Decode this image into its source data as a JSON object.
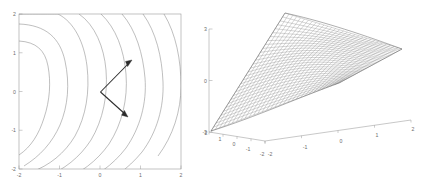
{
  "figure": {
    "title": "",
    "background_color": "#ffffff",
    "panel_count": 2
  },
  "chart_data": [
    {
      "type": "contour",
      "title": "",
      "xlabel": "",
      "ylabel": "",
      "xlim": [
        -2,
        2
      ],
      "ylim": [
        -2,
        2
      ],
      "xticks": [
        "-2",
        "-1",
        "0",
        "1",
        "2"
      ],
      "yticks": [
        "2",
        "1",
        "0",
        "-1",
        "-2"
      ],
      "xtick_values": [
        -2,
        -1,
        0,
        1,
        2
      ],
      "ytick_values": [
        2,
        1,
        0,
        -1,
        -2
      ],
      "grid": false,
      "legend": "none",
      "contour_count": 8,
      "contour_levels": [
        0.5,
        1.5,
        3,
        5,
        8,
        12,
        17,
        23
      ],
      "line_color": "#8a8a8a",
      "annotation": {
        "name": "gradient-vector-path",
        "type": "polyline-double-arrow",
        "color": "#2b2b2b",
        "points": [
          [
            0.72,
            0.62
          ],
          [
            0.02,
            0.0
          ],
          [
            0.66,
            -0.55
          ]
        ],
        "arrowheads": [
          "start",
          "end"
        ],
        "description": "V-shaped two-segment arrow with arrowheads at both outer tips, vertex near origin"
      }
    },
    {
      "type": "surface",
      "title": "",
      "xlabel": "",
      "ylabel": "",
      "zlabel": "",
      "xlim": [
        -2,
        2
      ],
      "ylim": [
        -2,
        2
      ],
      "zlim": [
        -3,
        3
      ],
      "xticks": [
        "-2",
        "-1",
        "0",
        "1",
        "2"
      ],
      "yticks": [
        "2",
        "1",
        "0",
        "-1",
        "-2"
      ],
      "zticks": [
        "3",
        "0",
        "-3"
      ],
      "xtick_values": [
        -2,
        -1,
        0,
        1,
        2
      ],
      "ytick_values": [
        2,
        1,
        0,
        -1,
        -2
      ],
      "ztick_values": [
        3,
        0,
        -3
      ],
      "grid": false,
      "legend": "none",
      "mesh_color": "#747474",
      "mesh_resolution": [
        30,
        30
      ],
      "view": {
        "azimuth": -37.5,
        "elevation": 30
      },
      "description": "Saddle-shaped wireframe mesh surface rising steeply to back-left ridge and tapering to a point at the near corner"
    }
  ],
  "panels": {
    "contour": {
      "name": "contour-plot"
    },
    "surface": {
      "name": "surface-plot"
    }
  }
}
